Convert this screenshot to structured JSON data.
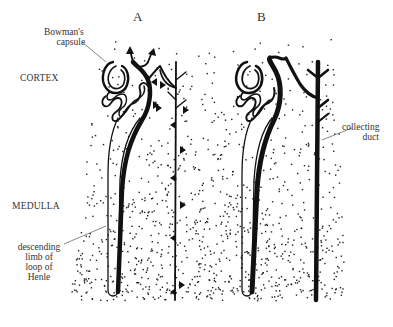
{
  "diagram": {
    "panels": [
      {
        "id": "A",
        "label": "A"
      },
      {
        "id": "B",
        "label": "B"
      }
    ],
    "regions": {
      "cortex": "CORTEX",
      "medulla": "MEDULLA"
    },
    "annotations": {
      "bowmans_capsule": [
        "Bowman's",
        "capsule"
      ],
      "collecting_duct": [
        "collecting",
        "duct"
      ],
      "descending_limb": [
        "descending",
        "limb of",
        "loop of",
        "Henle"
      ]
    },
    "colors": {
      "ink": "#111111",
      "dots": "#222222",
      "label": "#333333",
      "background": "#ffffff"
    }
  }
}
